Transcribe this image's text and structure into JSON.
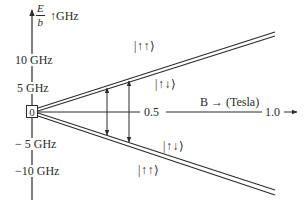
{
  "diagram": {
    "y_axis": {
      "label_fraction_numerator": "E",
      "label_fraction_denominator": "b",
      "label_unit": "↑GHz",
      "ticks": [
        {
          "label": "10 GHz",
          "value": 10
        },
        {
          "label": "5 GHz",
          "value": 5
        },
        {
          "label": "0",
          "value": 0
        },
        {
          "label": "− 5 GHz",
          "value": -5
        },
        {
          "label": "−10 GHz",
          "value": -10
        }
      ]
    },
    "x_axis": {
      "label": "B → (Tesla)",
      "ticks": [
        {
          "label": "0.5",
          "value": 0.5
        },
        {
          "label": "1.0",
          "value": 1.0
        }
      ],
      "end_arrow": "→"
    },
    "states": {
      "upper_outer": "|↑↑⟩",
      "upper_inner": "|↑↓⟩",
      "lower_inner": "|↑↓⟩",
      "lower_outer": "|↑↑⟩"
    },
    "colors": {
      "ink": "#2b2b2b",
      "background": "#ffffff"
    }
  }
}
